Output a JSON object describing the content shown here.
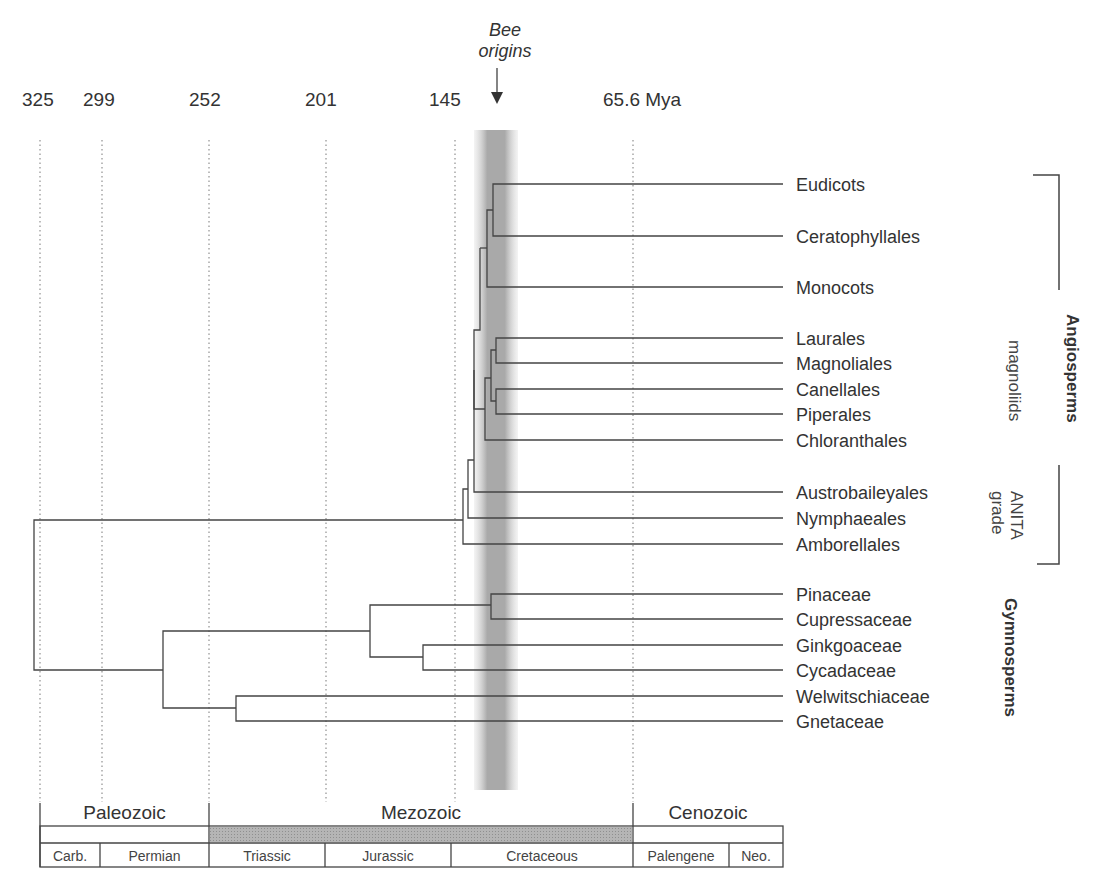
{
  "figure": {
    "annotation": {
      "line1": "Bee",
      "line2": "origins"
    },
    "time_axis": {
      "ticks": [
        "325",
        "299",
        "252",
        "201",
        "145",
        "65.6 Mya"
      ],
      "tick_values_mya": [
        325,
        299,
        252,
        201,
        145,
        65.6
      ]
    },
    "taxa": [
      "Eudicots",
      "Ceratophyllales",
      "Monocots",
      "Laurales",
      "Magnoliales",
      "Canellales",
      "Piperales",
      "Chloranthales",
      "Austrobaileyales",
      "Nymphaeales",
      "Amborellales",
      "Pinaceae",
      "Cupressaceae",
      "Ginkgoaceae",
      "Cycadaceae",
      "Welwitschiaceae",
      "Gnetaceae"
    ],
    "group_labels": {
      "angiosperms": "Angiosperms",
      "magnoliids": "magnoliids",
      "anita_line1": "ANITA",
      "anita_line2": "grade",
      "gymnosperms": "Gymnosperms"
    },
    "timescale": {
      "eras": [
        "Paleozoic",
        "Mezozoic",
        "Cenozoic"
      ],
      "periods": [
        "Carb.",
        "Permian",
        "Triassic",
        "Jurassic",
        "Cretaceous",
        "Palengene",
        "Neo."
      ]
    },
    "colors": {
      "line": "#444444",
      "band": "#9a9a9a",
      "mesozoic_fill": "#a8a8a8"
    }
  }
}
